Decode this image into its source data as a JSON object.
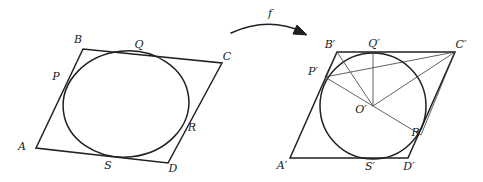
{
  "figure": {
    "map_label": "f",
    "left": {
      "name": "tangential-quadrilateral-ABCD",
      "vertices": [
        {
          "id": "A",
          "label": "A",
          "x": 36,
          "y": 148,
          "label_x": 22,
          "label_y": 147
        },
        {
          "id": "B",
          "label": "B",
          "x": 83,
          "y": 49,
          "label_x": 78,
          "label_y": 40
        },
        {
          "id": "C",
          "label": "C",
          "x": 222,
          "y": 63,
          "label_x": 227,
          "label_y": 57
        },
        {
          "id": "D",
          "label": "D",
          "x": 168,
          "y": 163,
          "label_x": 173,
          "label_y": 169
        }
      ],
      "tangent_points": [
        {
          "id": "P",
          "label": "P",
          "x": 66,
          "y": 84,
          "label_x": 56,
          "label_y": 77
        },
        {
          "id": "Q",
          "label": "Q",
          "x": 134,
          "y": 55,
          "label_x": 139,
          "label_y": 45
        },
        {
          "id": "R",
          "label": "R",
          "x": 185,
          "y": 131,
          "label_x": 192,
          "label_y": 128
        },
        {
          "id": "S",
          "label": "S",
          "x": 112,
          "y": 157,
          "label_x": 108,
          "label_y": 166
        }
      ],
      "incircle": {
        "cx": 126,
        "cy": 104,
        "rx": 63,
        "ry": 53,
        "rotation": -6
      }
    },
    "right": {
      "name": "rhombus-A-prime-B-prime-C-prime-D-prime",
      "vertices": [
        {
          "id": "A'",
          "label": "A′",
          "x": 290,
          "y": 158,
          "label_x": 282,
          "label_y": 166
        },
        {
          "id": "B'",
          "label": "B′",
          "x": 337,
          "y": 52,
          "label_x": 330,
          "label_y": 45
        },
        {
          "id": "C'",
          "label": "C′",
          "x": 455,
          "y": 52,
          "label_x": 461,
          "label_y": 45
        },
        {
          "id": "D'",
          "label": "D′",
          "x": 408,
          "y": 158,
          "label_x": 409,
          "label_y": 167
        }
      ],
      "center": {
        "id": "O'",
        "label": "O′",
        "x": 373,
        "y": 106,
        "label_x": 361,
        "label_y": 110
      },
      "tangent_points": [
        {
          "id": "P'",
          "label": "P′",
          "x": 325,
          "y": 77,
          "label_x": 313,
          "label_y": 72
        },
        {
          "id": "Q'",
          "label": "Q′",
          "x": 373,
          "y": 53,
          "label_x": 374,
          "label_y": 44
        },
        {
          "id": "R'",
          "label": "R′",
          "x": 421,
          "y": 135,
          "label_x": 417,
          "label_y": 133
        },
        {
          "id": "S'",
          "label": "S′",
          "x": 373,
          "y": 158,
          "label_x": 370,
          "label_y": 167
        }
      ],
      "incircle": {
        "cx": 373,
        "cy": 106,
        "r": 53
      },
      "radii": [
        {
          "from": "O'",
          "to": "P'"
        },
        {
          "from": "O'",
          "to": "Q'"
        },
        {
          "from": "O'",
          "to": "B'"
        }
      ],
      "chords": [
        {
          "from": "B'",
          "to": "P'"
        },
        {
          "from": "P'",
          "to": "C'"
        },
        {
          "from": "C'",
          "to": "R'"
        },
        {
          "from": "R'",
          "to": "O'"
        }
      ]
    },
    "arrow": {
      "name": "mapping-arrow",
      "start_x": 231,
      "start_y": 33,
      "end_x": 306,
      "end_y": 35,
      "label_x": 270,
      "label_y": 14
    },
    "colors": {
      "ink": "#231f20",
      "thin_ink": "#3a3a3a",
      "background": "#ffffff"
    }
  }
}
